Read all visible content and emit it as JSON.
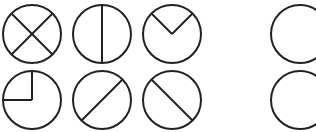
{
  "diagram": {
    "title": "",
    "stroke_color": "#222222",
    "background": "#ffffff",
    "figures": [
      {
        "id": "circle-x",
        "row": 1,
        "col": 1,
        "cx": 32,
        "cy": 34,
        "r": 29,
        "pattern": "two diagonals crossing (X)"
      },
      {
        "id": "circle-vertical",
        "row": 1,
        "col": 2,
        "cx": 102,
        "cy": 34,
        "r": 29,
        "pattern": "vertical diameter"
      },
      {
        "id": "circle-v",
        "row": 1,
        "col": 3,
        "cx": 172,
        "cy": 34,
        "r": 29,
        "pattern": "two radii forming V from upper-left and upper-right to center"
      },
      {
        "id": "circle-empty-top",
        "row": 1,
        "col": 5,
        "cx": 300,
        "cy": 34,
        "r": 29,
        "pattern": "empty circle"
      },
      {
        "id": "circle-quadrant",
        "row": 2,
        "col": 1,
        "cx": 32,
        "cy": 100,
        "r": 29,
        "pattern": "two radii: up and left (upper-left quadrant)"
      },
      {
        "id": "circle-slash",
        "row": 2,
        "col": 2,
        "cx": 102,
        "cy": 100,
        "r": 29,
        "pattern": "diagonal diameter lower-left to upper-right"
      },
      {
        "id": "circle-backslash",
        "row": 2,
        "col": 3,
        "cx": 172,
        "cy": 100,
        "r": 29,
        "pattern": "diagonal diameter upper-left to lower-right"
      },
      {
        "id": "circle-empty-bottom",
        "row": 2,
        "col": 5,
        "cx": 300,
        "cy": 100,
        "r": 29,
        "pattern": "empty circle"
      }
    ]
  }
}
